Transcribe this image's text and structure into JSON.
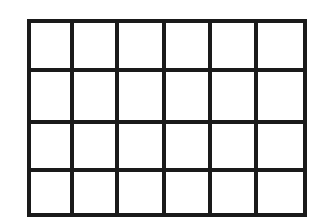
{
  "diagram": {
    "type": "grid",
    "columns": 6,
    "rows": 4,
    "line_color": "#1a1a1a",
    "background": "#ffffff",
    "stroke_width": 4,
    "column_lines_x": [
      29,
      72,
      117,
      164,
      210,
      256,
      305
    ],
    "row_lines_y": [
      21,
      70,
      122,
      170,
      215
    ]
  }
}
